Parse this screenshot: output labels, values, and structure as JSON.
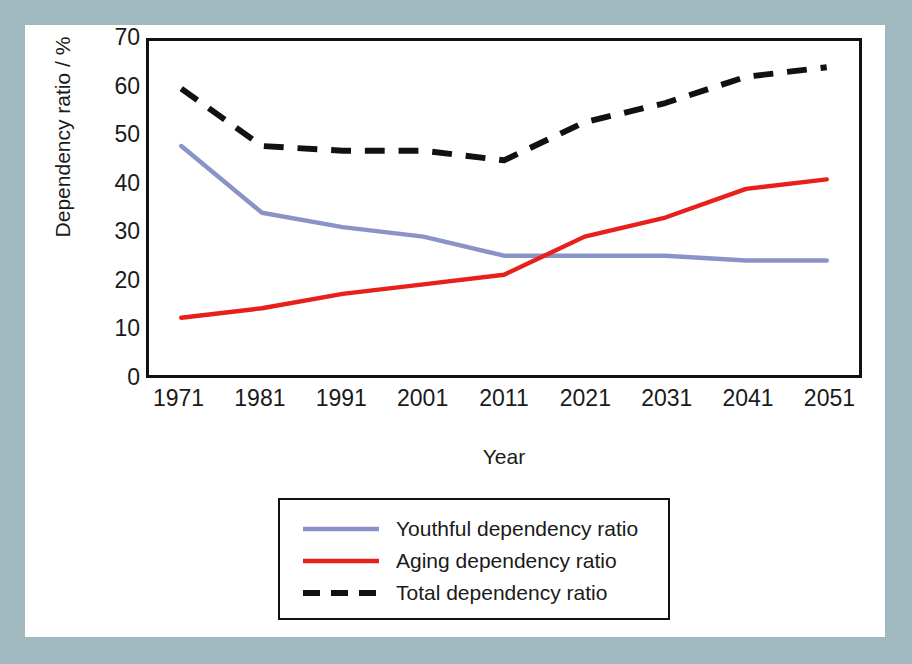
{
  "chart_data": {
    "type": "line",
    "title": "",
    "xlabel": "Year",
    "ylabel": "Dependency ratio / %",
    "x": [
      1971,
      1981,
      1991,
      2001,
      2011,
      2021,
      2031,
      2041,
      2051
    ],
    "xtick_labels": [
      "1971",
      "1981",
      "1991",
      "2001",
      "2011",
      "2021",
      "2031",
      "2041",
      "2051"
    ],
    "ytick_labels": [
      "0",
      "10",
      "20",
      "30",
      "40",
      "50",
      "60",
      "70"
    ],
    "yticks": [
      0,
      10,
      20,
      30,
      40,
      50,
      60,
      70
    ],
    "ylim": [
      0,
      70
    ],
    "xlim": [
      1967,
      2055
    ],
    "grid": false,
    "legend_position": "below-axes-center",
    "series": [
      {
        "name": "Youthful dependency ratio",
        "color": "#8a93c8",
        "style": "solid",
        "values": [
          48,
          34,
          31,
          29,
          25,
          25,
          25,
          24,
          24
        ]
      },
      {
        "name": "Aging dependency ratio",
        "color": "#e8201c",
        "style": "solid",
        "values": [
          12,
          14,
          17,
          19,
          21,
          29,
          33,
          39,
          41
        ]
      },
      {
        "name": "Total dependency ratio",
        "color": "#111111",
        "style": "dashed",
        "values": [
          60,
          48,
          47,
          47,
          45,
          53,
          57,
          62.5,
          64.5
        ]
      }
    ]
  },
  "legend": {
    "items": [
      {
        "label": "Youthful dependency ratio",
        "icon": "solid-line-swatch"
      },
      {
        "label": "Aging dependency ratio",
        "icon": "solid-line-swatch"
      },
      {
        "label": "Total dependency ratio",
        "icon": "dashed-line-swatch"
      }
    ]
  },
  "colors": {
    "background_mount": "#9fb9bf",
    "card": "#ffffff",
    "axis": "#111111",
    "youthful": "#8a93c8",
    "aging": "#e8201c",
    "total": "#111111"
  }
}
